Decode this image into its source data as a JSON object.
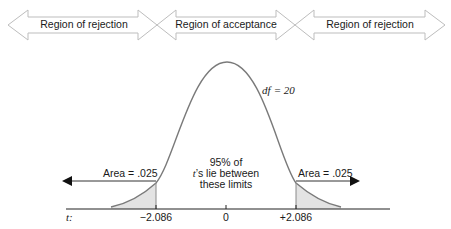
{
  "regions": [
    {
      "label": "Region of rejection"
    },
    {
      "label": "Region of acceptance"
    },
    {
      "label": "Region of rejection"
    }
  ],
  "curve": {
    "df_label": "df = 20",
    "df_symbol": "df",
    "df_value": "= 20"
  },
  "center_note": {
    "line1": "95% of",
    "line2_t": "t",
    "line2_rest": "’s lie between",
    "line3": "these limits"
  },
  "tails": {
    "left_label": "Area = .025",
    "right_label": "Area = .025"
  },
  "axis": {
    "variable_label": "t:",
    "ticks": [
      "−2.086",
      "0",
      "+2.086"
    ]
  },
  "colors": {
    "curve": "#7a7a7a",
    "shade": "#e3e3e3",
    "region_arrow_stroke": "#bdbdbd",
    "axis": "#222222"
  }
}
